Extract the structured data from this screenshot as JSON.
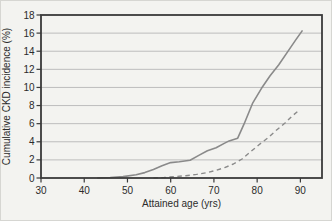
{
  "figure": {
    "background": "#f3f3f0",
    "frame_color": "#3a3a3a",
    "grid_color": "#bdbdbd",
    "line_color": "#8a8a8a",
    "text_color": "#2b2b2b"
  },
  "chart_data": {
    "type": "line",
    "xlabel": "Attained age (yrs)",
    "ylabel": "Cumulative CKD incidence (%)",
    "xlim": [
      30,
      95
    ],
    "ylim": [
      0,
      18
    ],
    "x_ticks": [
      30,
      40,
      50,
      60,
      70,
      80,
      90
    ],
    "y_ticks": [
      0,
      2,
      4,
      6,
      8,
      10,
      12,
      14,
      16,
      18
    ],
    "grid": "horizontal",
    "legend": "none",
    "series": [
      {
        "name": "solid-line",
        "style": "solid",
        "x": [
          43,
          46,
          49,
          52,
          54,
          56,
          58,
          60,
          62,
          64.5,
          66.5,
          68.5,
          70.5,
          72.5,
          73.5,
          75.5,
          77,
          79,
          81,
          83,
          85,
          87,
          89,
          90.5
        ],
        "y": [
          0,
          0.05,
          0.15,
          0.35,
          0.6,
          0.95,
          1.35,
          1.7,
          1.8,
          1.95,
          2.5,
          3.0,
          3.35,
          3.85,
          4.1,
          4.4,
          6.0,
          8.3,
          9.9,
          11.3,
          12.5,
          13.9,
          15.3,
          16.3
        ]
      },
      {
        "name": "dashed-line",
        "style": "dashed",
        "x": [
          56,
          58.5,
          61,
          63.5,
          66,
          68.5,
          70.5,
          72.5,
          74.5,
          76.5,
          78.5,
          80.5,
          82.5,
          84.5,
          86.5,
          88,
          89.5
        ],
        "y": [
          0,
          0.05,
          0.15,
          0.25,
          0.4,
          0.6,
          0.85,
          1.15,
          1.55,
          2.1,
          2.9,
          3.7,
          4.45,
          5.3,
          6.1,
          6.8,
          7.4
        ]
      }
    ]
  }
}
